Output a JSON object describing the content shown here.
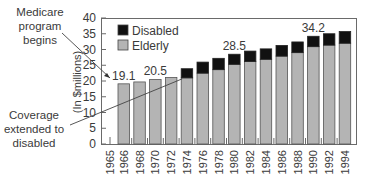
{
  "chart_data": {
    "type": "bar",
    "stacked": true,
    "title": "",
    "xlabel": "",
    "ylabel": "(In $millions)",
    "ylim": [
      0,
      40
    ],
    "yticks": [
      0,
      5,
      10,
      15,
      20,
      25,
      30,
      35,
      40
    ],
    "grid": false,
    "legend": {
      "position": "top-left-inside",
      "entries": [
        "Disabled",
        "Elderly"
      ]
    },
    "x_tick_labels": [
      "1965",
      "1966",
      "1968",
      "1970",
      "1972",
      "1974",
      "1976",
      "1978",
      "1980",
      "1982",
      "1984",
      "1986",
      "1988",
      "1990",
      "1992",
      "1994"
    ],
    "categories": [
      "1966",
      "1968",
      "1970",
      "1972",
      "1974",
      "1976",
      "1978",
      "1980",
      "1982",
      "1984",
      "1986",
      "1988",
      "1990",
      "1992",
      "1994"
    ],
    "series": [
      {
        "name": "Elderly",
        "color": "#b4b4b4",
        "values": [
          19.1,
          19.7,
          20.5,
          21.1,
          21.0,
          22.5,
          23.6,
          25.3,
          26.2,
          26.9,
          27.9,
          29.0,
          30.9,
          31.4,
          32.0
        ]
      },
      {
        "name": "Disabled",
        "color": "#111111",
        "values": [
          0,
          0,
          0,
          0,
          2.9,
          3.5,
          3.6,
          3.2,
          3.3,
          3.3,
          3.4,
          3.4,
          3.3,
          3.6,
          3.7
        ]
      }
    ],
    "data_labels": [
      {
        "category": "1966",
        "text": "19.1"
      },
      {
        "category": "1970",
        "text": "20.5"
      },
      {
        "category": "1980",
        "text": "28.5"
      },
      {
        "category": "1990",
        "text": "34.2"
      }
    ],
    "annotations": [
      {
        "text": "Medicare program begins",
        "lines": [
          "Medicare",
          "program",
          "begins"
        ],
        "points_to": "1966"
      },
      {
        "text": "Coverage extended to disabled",
        "lines": [
          "Coverage",
          "extended to",
          "disabled"
        ],
        "points_to": "1974"
      }
    ]
  }
}
